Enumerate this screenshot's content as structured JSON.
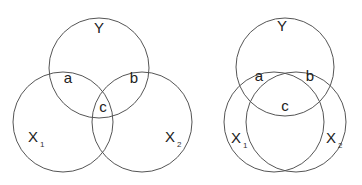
{
  "diagrams": [
    {
      "id": "left",
      "description": "Three-circle Venn diagram with partial overlap",
      "circles": [
        {
          "name": "Y",
          "label": "Y",
          "subscript": ""
        },
        {
          "name": "X1",
          "label": "X",
          "subscript": "1"
        },
        {
          "name": "X2",
          "label": "X",
          "subscript": "2"
        }
      ],
      "regions": [
        {
          "name": "a",
          "label": "a"
        },
        {
          "name": "b",
          "label": "b"
        },
        {
          "name": "c",
          "label": "c"
        }
      ]
    },
    {
      "id": "right",
      "description": "Three-circle Venn diagram with heavy overlap",
      "circles": [
        {
          "name": "Y",
          "label": "Y",
          "subscript": ""
        },
        {
          "name": "X1",
          "label": "X",
          "subscript": "1"
        },
        {
          "name": "X2",
          "label": "X",
          "subscript": "2"
        }
      ],
      "regions": [
        {
          "name": "a",
          "label": "a"
        },
        {
          "name": "b",
          "label": "b"
        },
        {
          "name": "c",
          "label": "c"
        }
      ]
    }
  ],
  "colors": {
    "stroke": "#555555",
    "text": "#222222",
    "background": "#ffffff"
  }
}
